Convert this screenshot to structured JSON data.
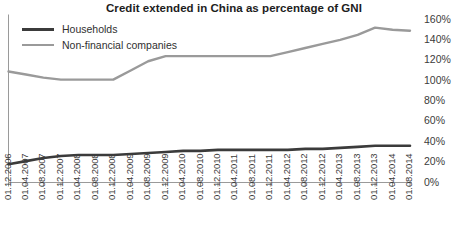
{
  "chart_data": {
    "type": "line",
    "title": "Credit extended in China as percentage of GNI",
    "xlabel": "",
    "ylabel": "",
    "ylim": [
      0,
      160
    ],
    "ytick_step": 20,
    "grid": false,
    "legend_position": "top-left",
    "yticks": [
      "0%",
      "20%",
      "40%",
      "60%",
      "80%",
      "100%",
      "120%",
      "140%",
      "160%"
    ],
    "categories": [
      "01.12.2006",
      "01.04.2007",
      "01.08.2007",
      "01.12.2007",
      "01.04.2008",
      "01.08.2008",
      "01.12.2008",
      "01.04.2009",
      "01.08.2009",
      "01.12.2009",
      "01.04.2010",
      "01.08.2010",
      "01.12.2010",
      "01.04.2011",
      "01.08.2011",
      "01.12.2011",
      "01.04.2012",
      "01.08.2012",
      "01.12.2012",
      "01.04.2013",
      "01.08.2013",
      "01.12.2013",
      "01.04.2014",
      "01.08.2014"
    ],
    "series": [
      {
        "name": "Households",
        "color": "#3b3b3b",
        "values": [
          18,
          21,
          24,
          26,
          27,
          27,
          27,
          28,
          29,
          30,
          31,
          31,
          32,
          32,
          32,
          32,
          32,
          33,
          33,
          34,
          35,
          36,
          36,
          36
        ]
      },
      {
        "name": "Non-financial companies",
        "color": "#9a9a9a",
        "values": [
          109,
          106,
          103,
          101,
          101,
          101,
          101,
          110,
          119,
          124,
          124,
          124,
          124,
          124,
          124,
          124,
          128,
          132,
          136,
          140,
          145,
          152,
          150,
          149
        ]
      }
    ]
  },
  "legend": {
    "items": [
      {
        "label": "Households",
        "color": "#3b3b3b",
        "width": 3
      },
      {
        "label": "Non-financial companies",
        "color": "#9a9a9a",
        "width": 2.5
      }
    ]
  },
  "axis": {
    "line_color": "#9a9a9a",
    "tick_color": "#9a9a9a"
  }
}
